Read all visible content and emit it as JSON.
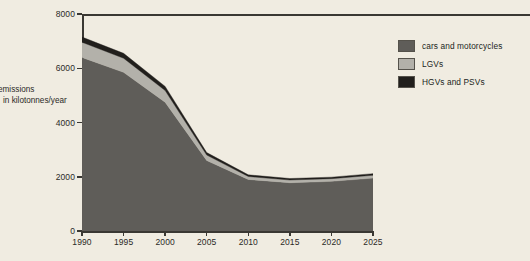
{
  "chart_data": {
    "type": "area",
    "stacked": true,
    "title": "",
    "xlabel": "",
    "ylabel": "emissions in kilotonnes/year",
    "ylabel_lines": [
      "emissions",
      "in kilotonnes/year"
    ],
    "x": [
      1990,
      1995,
      2000,
      2005,
      2010,
      2015,
      2020,
      2025
    ],
    "xlim": [
      1990,
      2025
    ],
    "ylim": [
      0,
      8000
    ],
    "xticks": [
      "1990",
      "1995",
      "2000",
      "2005",
      "2010",
      "2015",
      "2020",
      "2025"
    ],
    "yticks": [
      "0",
      "2000",
      "4000",
      "6000",
      "8000"
    ],
    "grid": false,
    "legend_position": "right",
    "series": [
      {
        "name": "cars and motorcycles",
        "color": "#5f5d59",
        "values": [
          6400,
          5850,
          4750,
          2600,
          1900,
          1780,
          1830,
          1950
        ]
      },
      {
        "name": "LGVs",
        "color": "#b3b1aa",
        "values": [
          560,
          520,
          430,
          200,
          110,
          100,
          100,
          105
        ]
      },
      {
        "name": "HGVs and PSVs",
        "color": "#211f1c",
        "values": [
          190,
          180,
          150,
          90,
          60,
          55,
          55,
          60
        ]
      }
    ],
    "totals": [
      7150,
      6550,
      5330,
      2890,
      2070,
      1935,
      1985,
      2115
    ]
  },
  "legend": {
    "items": [
      {
        "label": "cars and motorcycles",
        "color": "#5f5d59"
      },
      {
        "label": "LGVs",
        "color": "#b3b1aa"
      },
      {
        "label": "HGVs and PSVs",
        "color": "#211f1c"
      }
    ]
  }
}
